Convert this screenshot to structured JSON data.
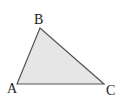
{
  "diagram": {
    "type": "triangle",
    "fill_color": "#e6e6e6",
    "stroke_color": "#555555",
    "vertices": [
      {
        "name": "A",
        "x": 17,
        "y": 84,
        "label_x": 7,
        "label_y": 93
      },
      {
        "name": "B",
        "x": 40,
        "y": 28,
        "label_x": 34,
        "label_y": 24
      },
      {
        "name": "C",
        "x": 104,
        "y": 84,
        "label_x": 106,
        "label_y": 95
      }
    ],
    "labels": {
      "a": "A",
      "b": "B",
      "c": "C"
    }
  }
}
